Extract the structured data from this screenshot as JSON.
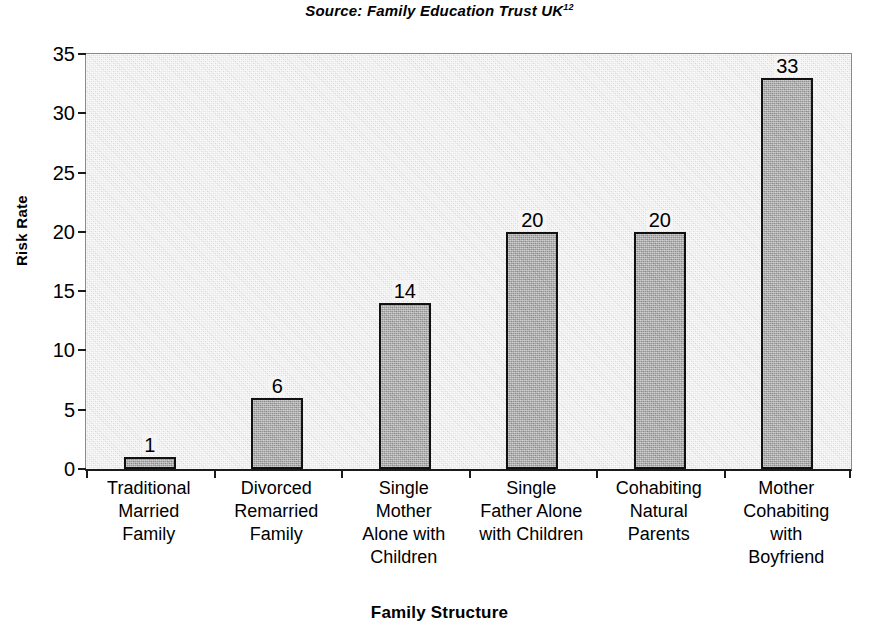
{
  "source": {
    "text": "Source:  Family  Education Trust UK",
    "superscript": "12"
  },
  "axis_titles": {
    "y": "Risk Rate",
    "x": "Family Structure"
  },
  "colors": {
    "plot_background": "#e9e9e9",
    "bar_fill": "#a8a8a8",
    "bar_border": "#111111",
    "text": "#000000"
  },
  "chart_data": {
    "type": "bar",
    "title": "",
    "subtitle": "Source:  Family  Education Trust UK12",
    "xlabel": "Family Structure",
    "ylabel": "Risk Rate",
    "ylim": [
      0,
      35
    ],
    "yticks": [
      0,
      5,
      10,
      15,
      20,
      25,
      30,
      35
    ],
    "ytick_labels": [
      "0",
      "5",
      "10",
      "15",
      "20",
      "25",
      "30",
      "35"
    ],
    "grid": false,
    "legend": false,
    "data_labels": true,
    "categories": [
      "Traditional Married Family",
      "Divorced Remarried Family",
      "Single Mother Alone with Children",
      "Single Father Alone with Children",
      "Cohabiting Natural Parents",
      "Mother Cohabiting with Boyfriend"
    ],
    "category_lines": [
      [
        "Traditional",
        "Married",
        "Family"
      ],
      [
        "Divorced",
        "Remarried",
        "Family"
      ],
      [
        "Single",
        "Mother",
        "Alone with",
        "Children"
      ],
      [
        "Single",
        "Father Alone",
        "with Children"
      ],
      [
        "Cohabiting",
        "Natural",
        "Parents"
      ],
      [
        "Mother",
        "Cohabiting",
        "with",
        "Boyfriend"
      ]
    ],
    "values": [
      1,
      6,
      14,
      20,
      20,
      33
    ],
    "value_labels": [
      "1",
      "6",
      "14",
      "20",
      "20",
      "33"
    ]
  }
}
